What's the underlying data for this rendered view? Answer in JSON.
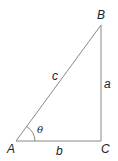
{
  "diagram": {
    "type": "right-triangle",
    "vertices": {
      "A": {
        "label": "A",
        "x": 16,
        "y": 141
      },
      "B": {
        "label": "B",
        "x": 101,
        "y": 25
      },
      "C": {
        "label": "C",
        "x": 101,
        "y": 141
      }
    },
    "sides": {
      "a": {
        "label": "a",
        "between": [
          "B",
          "C"
        ]
      },
      "b": {
        "label": "b",
        "between": [
          "A",
          "C"
        ]
      },
      "c": {
        "label": "c",
        "between": [
          "A",
          "B"
        ]
      }
    },
    "angle": {
      "label": "θ",
      "at": "A"
    },
    "line_color": "#888888"
  }
}
